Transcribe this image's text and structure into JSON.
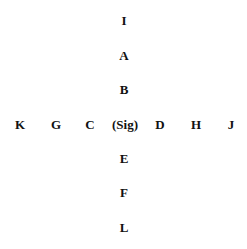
{
  "diagram": {
    "type": "cross-arrangement",
    "center": "(Sig)",
    "vertical": [
      "I",
      "A",
      "B",
      "(Sig)",
      "E",
      "F",
      "L"
    ],
    "horizontal": [
      "K",
      "G",
      "C",
      "(Sig)",
      "D",
      "H",
      "J"
    ],
    "labels": {
      "I": "I",
      "A": "A",
      "B": "B",
      "K": "K",
      "G": "G",
      "C": "C",
      "Sig": "(Sig)",
      "D": "D",
      "H": "H",
      "J": "J",
      "E": "E",
      "F": "F",
      "L": "L"
    }
  }
}
